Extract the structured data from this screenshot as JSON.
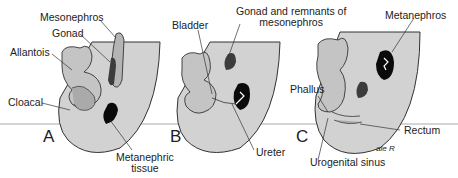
{
  "colors": {
    "body_fill": "#d2d2d2",
    "organ_fill": "#b4b4b4",
    "dark_organ": "#3c3c3c",
    "kidney": "#0a0a0a",
    "outline": "#333333",
    "horizon_line": "#aaaaaa"
  },
  "panels": [
    {
      "letter": "A",
      "labels": {
        "mesonephros": "Mesonephros",
        "gonad": "Gonad",
        "allantois": "Allantois",
        "cloacal": "Cloacal",
        "metanephric_1": "Metanephric",
        "metanephric_2": "tissue"
      }
    },
    {
      "letter": "B",
      "labels": {
        "bladder": "Bladder",
        "gonad_remnants_1": "Gonad and remnants of",
        "gonad_remnants_2": "mesonephros",
        "ureter": "Ureter"
      }
    },
    {
      "letter": "C",
      "labels": {
        "metanephros": "Metanephros",
        "phallus": "Phallus",
        "rectum": "Rectum",
        "urogenital_sinus": "Urogenital sinus"
      }
    }
  ],
  "signature": "ale R"
}
